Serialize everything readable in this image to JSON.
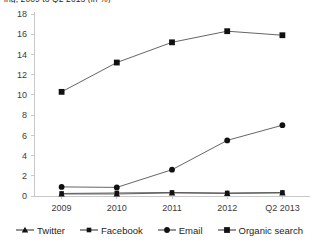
{
  "chart_data": {
    "type": "line",
    "title": "ing, 2009 to Q2 2013 (in %)",
    "xlabel": "",
    "ylabel": "",
    "categories": [
      "2009",
      "2010",
      "2011",
      "2012",
      "Q2 2013"
    ],
    "ylim": [
      0,
      18
    ],
    "ytick_step": 2,
    "yticks": [
      "0",
      "2",
      "4",
      "6",
      "8",
      "10",
      "12",
      "14",
      "16",
      "18"
    ],
    "grid": false,
    "legend_position": "bottom",
    "series": [
      {
        "name": "Twitter",
        "marker": "triangle",
        "color": "#111111",
        "values": [
          0.2,
          0.2,
          0.3,
          0.25,
          0.3
        ]
      },
      {
        "name": "Facebook",
        "marker": "square-small",
        "color": "#111111",
        "values": [
          0.25,
          0.3,
          0.35,
          0.3,
          0.35
        ]
      },
      {
        "name": "Email",
        "marker": "circle",
        "color": "#111111",
        "values": [
          0.9,
          0.85,
          2.6,
          5.5,
          7.0
        ]
      },
      {
        "name": "Organic search",
        "marker": "square",
        "color": "#111111",
        "values": [
          10.3,
          13.2,
          15.2,
          16.3,
          15.9
        ]
      }
    ]
  }
}
